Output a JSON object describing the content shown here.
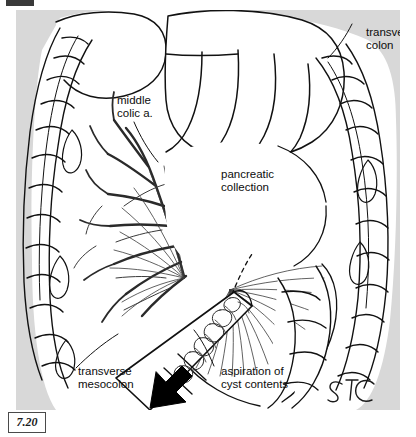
{
  "figure": {
    "number": "7.20",
    "signature": "STC",
    "background_color": "#d8d8d8",
    "ink_color": "#111111",
    "paper_color": "#ffffff"
  },
  "labels": {
    "transverse_colon": "transverse\ncolon",
    "middle_colic_artery": "middle\ncolic a.",
    "pancreatic_collection": "pancreatic\ncollection",
    "transverse_mesocolon": "transverse\nmesocolon",
    "aspiration": "aspiration of\ncyst contents"
  },
  "structures": [
    {
      "name": "transverse-colon",
      "note": "haustrated bowel loops at left and right margins"
    },
    {
      "name": "greater-omentum",
      "note": "lobulated mass filling upper field"
    },
    {
      "name": "middle-colic-artery",
      "note": "branching mesenteric arcade, left of centre"
    },
    {
      "name": "pancreatic-collection",
      "note": "cyst cavity behind the mesocolon"
    },
    {
      "name": "transverse-mesocolon",
      "note": "fan of radiating leaves below the collection"
    },
    {
      "name": "aspiration-needle",
      "note": "cannula entering from lower left with cyst contents inside"
    },
    {
      "name": "needle-path",
      "note": "dashed line marking concealed needle tip"
    },
    {
      "name": "withdrawal-arrow",
      "note": "solid black arrow inside the cannula"
    }
  ]
}
